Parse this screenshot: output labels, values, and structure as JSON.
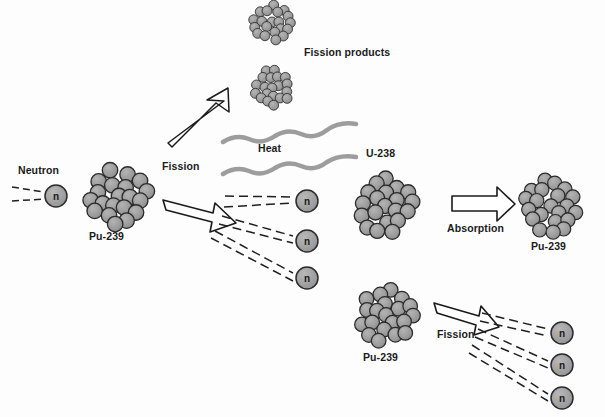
{
  "diagram": {
    "title_clipped": "",
    "background_color": "#fdfdfd",
    "nucleus_fill": "#9a9a9a",
    "nucleus_stroke": "#2a2a2a",
    "neutron_fill": "#9e9e9e",
    "neutron_stroke": "#2b2b2b",
    "heat_wave_color": "#9d9d9d",
    "arrow_stroke": "#1a1a1a",
    "dash_color": "#1f1f1f",
    "text_color": "#1b1b1b"
  },
  "labels": {
    "neutron": "Neutron",
    "pu239_left": "Pu-239",
    "fission_left": "Fission",
    "fission_products": "Fission products",
    "heat": "Heat",
    "u238": "U-238",
    "absorption": "Absorption",
    "pu239_right": "Pu-239",
    "pu239_bottom": "Pu-239",
    "fission_bottom": "Fission"
  },
  "neutron_glyph": "n",
  "nuclei": [
    {
      "name": "pu239-left-nucleus",
      "cx": 119,
      "cy": 196,
      "r": 36,
      "label": "Pu-239"
    },
    {
      "name": "fission-product-top-nucleus",
      "cx": 272,
      "cy": 22,
      "r": 23,
      "label": ""
    },
    {
      "name": "fission-product-bottom-nucleus",
      "cx": 272,
      "cy": 88,
      "r": 23,
      "label": ""
    },
    {
      "name": "u238-nucleus",
      "cx": 385,
      "cy": 206,
      "r": 35,
      "label": "U-238"
    },
    {
      "name": "pu239-right-nucleus",
      "cx": 551,
      "cy": 206,
      "r": 33,
      "label": "Pu-239"
    },
    {
      "name": "pu239-bottom-nucleus",
      "cx": 386,
      "cy": 315,
      "r": 34,
      "label": "Pu-239"
    }
  ],
  "neutrons": [
    {
      "name": "incoming-neutron",
      "cx": 56,
      "cy": 196,
      "r": 11
    },
    {
      "name": "emitted-neutron-1",
      "cx": 307,
      "cy": 201,
      "r": 11
    },
    {
      "name": "emitted-neutron-2",
      "cx": 307,
      "cy": 241,
      "r": 11
    },
    {
      "name": "emitted-neutron-3",
      "cx": 307,
      "cy": 278,
      "r": 11
    },
    {
      "name": "bottom-emitted-neutron-1",
      "cx": 562,
      "cy": 333,
      "r": 11
    },
    {
      "name": "bottom-emitted-neutron-2",
      "cx": 562,
      "cy": 365,
      "r": 11
    },
    {
      "name": "bottom-emitted-neutron-3",
      "cx": 562,
      "cy": 398,
      "r": 11
    }
  ],
  "label_positions": {
    "neutron": {
      "x": 18,
      "y": 170
    },
    "pu239_left": {
      "x": 89,
      "y": 235
    },
    "fission_left": {
      "x": 162,
      "y": 165
    },
    "fission_products": {
      "x": 304,
      "y": 50
    },
    "heat": {
      "x": 258,
      "y": 147
    },
    "u238": {
      "x": 366,
      "y": 152
    },
    "absorption": {
      "x": 447,
      "y": 227
    },
    "pu239_right": {
      "x": 531,
      "y": 245
    },
    "pu239_bottom": {
      "x": 363,
      "y": 356
    },
    "fission_bottom": {
      "x": 437,
      "y": 333
    }
  },
  "heat_waves": [
    {
      "name": "heat-wave-upper",
      "x1": 223,
      "y1": 141,
      "x2": 355,
      "y2": 124
    },
    {
      "name": "heat-wave-lower",
      "x1": 223,
      "y1": 173,
      "x2": 355,
      "y2": 158
    }
  ],
  "arrows": [
    {
      "name": "fission-products-arrow",
      "type": "thin-hollow",
      "from": [
        172,
        139
      ],
      "to": [
        227,
        104
      ]
    },
    {
      "name": "fission-neutrons-arrow",
      "type": "block-hollow",
      "from": [
        166,
        204
      ],
      "to": [
        232,
        222
      ]
    },
    {
      "name": "absorption-arrow",
      "type": "block-hollow",
      "from": [
        456,
        203
      ],
      "to": [
        508,
        203
      ]
    },
    {
      "name": "bottom-fission-arrow",
      "type": "block-hollow",
      "from": [
        438,
        308
      ],
      "to": [
        492,
        330
      ]
    }
  ]
}
